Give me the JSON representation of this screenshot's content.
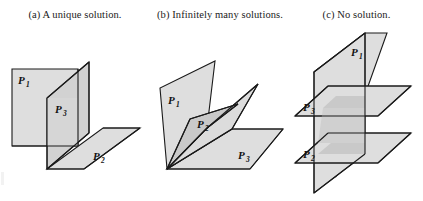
{
  "figure": {
    "type": "geometry-diagram",
    "background_color": "#ffffff",
    "stroke_color": "#1a1a1a",
    "fill_light": "#dedede",
    "fill_mid": "#d2d2d2",
    "fill_dark": "#c8c8c8"
  },
  "panels": [
    {
      "key": "a",
      "caption": "(a) A unique solution.",
      "description": "Three planes meeting at a single point",
      "planes": [
        {
          "id": "P1",
          "letter": "P",
          "subscript": "1",
          "label": "P₁"
        },
        {
          "id": "P3",
          "letter": "P",
          "subscript": "3",
          "label": "P₃"
        },
        {
          "id": "P2",
          "letter": "P",
          "subscript": "2",
          "label": "P₂"
        }
      ]
    },
    {
      "key": "b",
      "caption": "(b) Infinitely many solutions.",
      "description": "Three planes meeting along a common line",
      "planes": [
        {
          "id": "P1",
          "letter": "P",
          "subscript": "1",
          "label": "P₁"
        },
        {
          "id": "P2",
          "letter": "P",
          "subscript": "2",
          "label": "P₂"
        },
        {
          "id": "P3",
          "letter": "P",
          "subscript": "3",
          "label": "P₃"
        }
      ]
    },
    {
      "key": "c",
      "caption": "(c) No solution.",
      "description": "A vertical plane crossing two parallel horizontal planes",
      "planes": [
        {
          "id": "P1",
          "letter": "P",
          "subscript": "1",
          "label": "P₁"
        },
        {
          "id": "P3",
          "letter": "P",
          "subscript": "3",
          "label": "P₃"
        },
        {
          "id": "P2",
          "letter": "P",
          "subscript": "2",
          "label": "P₂"
        }
      ]
    }
  ]
}
